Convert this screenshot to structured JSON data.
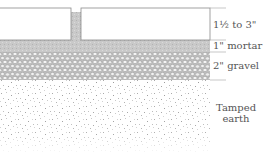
{
  "diagram": {
    "type": "cross-section",
    "layers": [
      {
        "id": "pavers",
        "label": "1½ to 3\"",
        "top": 8,
        "bottom": 40
      },
      {
        "id": "mortar",
        "label": "1\" mortar",
        "top": 40,
        "bottom": 52
      },
      {
        "id": "gravel",
        "label": "2\" gravel",
        "top": 52,
        "bottom": 80
      },
      {
        "id": "earth",
        "label_line1": "Tamped",
        "label_line2": "earth",
        "top": 80,
        "bottom": 152
      }
    ],
    "colors": {
      "paver_fill": "#ffffff",
      "paver_stroke": "#8a8a8a",
      "mortar": "#c8c8c8",
      "gravel_bg": "#d6d6d6",
      "gravel_stone": "#f4f4f4",
      "earth_speckle": "#9a9a9a",
      "label_text": "#555555",
      "tick_line": "#b0b0b0"
    }
  }
}
